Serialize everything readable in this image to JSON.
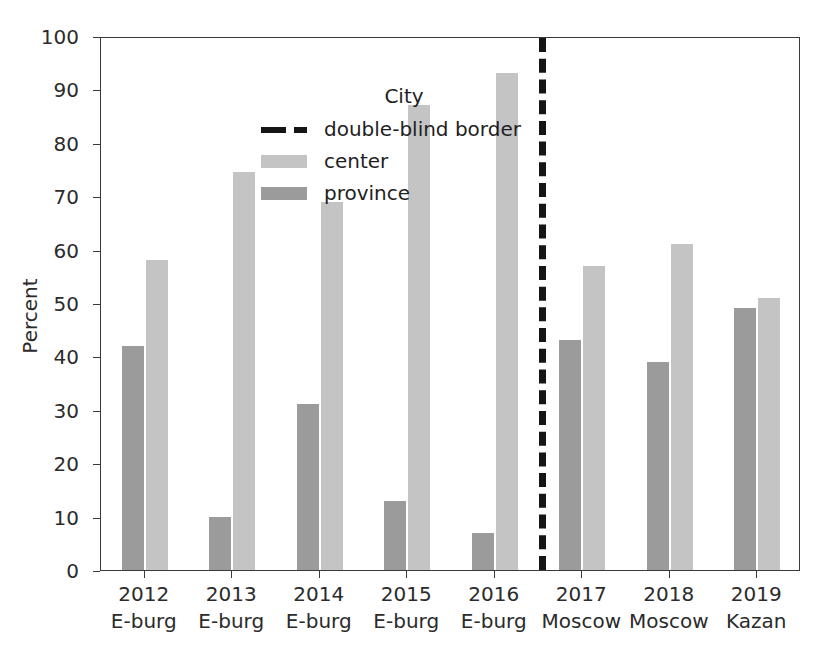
{
  "chart_data": {
    "type": "bar",
    "title": "",
    "xlabel": "",
    "ylabel": "Percent",
    "ylim": [
      0,
      100
    ],
    "ytick_values": [
      0,
      10,
      20,
      30,
      40,
      50,
      60,
      70,
      80,
      90,
      100
    ],
    "ytick_labels": [
      "0",
      "10",
      "20",
      "30",
      "40",
      "50",
      "60",
      "70",
      "80",
      "90",
      "100"
    ],
    "grid": false,
    "legend": {
      "title": "City",
      "position": "upper-left-inside",
      "entries": [
        {
          "label": "double-blind border",
          "style": "dashed-line",
          "color": "#151515"
        },
        {
          "label": "center",
          "style": "bar",
          "color": "#c4c4c4"
        },
        {
          "label": "province",
          "style": "bar",
          "color": "#9b9b9b"
        }
      ]
    },
    "categories": [
      "2012",
      "2013",
      "2014",
      "2015",
      "2016",
      "2017",
      "2018",
      "2019"
    ],
    "category_sublabels": [
      "E-burg",
      "E-burg",
      "E-burg",
      "E-burg",
      "E-burg",
      "Moscow",
      "Moscow",
      "Kazan"
    ],
    "xtick_labels": [
      {
        "line1": "2012",
        "line2": "E-burg"
      },
      {
        "line1": "2013",
        "line2": "E-burg"
      },
      {
        "line1": "2014",
        "line2": "E-burg"
      },
      {
        "line1": "2015",
        "line2": "E-burg"
      },
      {
        "line1": "2016",
        "line2": "E-burg"
      },
      {
        "line1": "2017",
        "line2": "Moscow"
      },
      {
        "line1": "2018",
        "line2": "Moscow"
      },
      {
        "line1": "2019",
        "line2": "Kazan"
      }
    ],
    "series": [
      {
        "name": "province",
        "color": "#9b9b9b",
        "values": [
          42,
          10,
          31,
          13,
          7,
          43,
          39,
          49
        ]
      },
      {
        "name": "center",
        "color": "#c4c4c4",
        "values": [
          58,
          74.5,
          69,
          87,
          93,
          57,
          61,
          51
        ]
      }
    ],
    "annotations": [
      {
        "type": "vline",
        "label": "double-blind border",
        "after_category": "2016",
        "x_between": [
          "2016",
          "2017"
        ],
        "color": "#151515",
        "linestyle": "dashed",
        "linewidth": 7
      }
    ]
  }
}
